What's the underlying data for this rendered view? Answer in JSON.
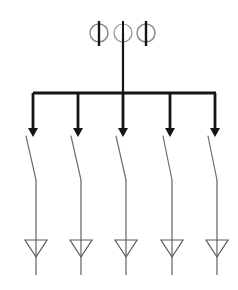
{
  "canvas": {
    "width": 238,
    "height": 290,
    "background": "#ffffff",
    "title": "Electrical Single Line Diagram - Busbar with Five Feeders"
  },
  "colors": {
    "heavy_line": "#151515",
    "medium_line": "#3a3a3a",
    "light_line": "#6e6e6e",
    "circle_stroke": "#8c8c8c",
    "triangle_stroke": "#5a5a5a",
    "background": "#ffffff"
  },
  "incomer": {
    "label": "Incoming Feeder",
    "line": {
      "x": 123,
      "y_top": 33,
      "y_bottom": 93,
      "width": 2.2
    },
    "instrument_transformers": [
      {
        "id": "ct-left",
        "label": "Instrument Transformer 1",
        "cx": 99,
        "cy": 33,
        "r": 9,
        "bar_top": 21,
        "bar_bottom": 46,
        "bar_width": 2.4,
        "ring_width": 1.5
      },
      {
        "id": "ct-center",
        "label": "Instrument Transformer 2",
        "cx": 123,
        "cy": 33,
        "r": 9,
        "bar_top": 21,
        "bar_bottom": 46,
        "bar_width": 2.0,
        "ring_width": 1.2
      },
      {
        "id": "ct-right",
        "label": "Instrument Transformer 3",
        "cx": 146,
        "cy": 33,
        "r": 9,
        "bar_top": 21,
        "bar_bottom": 46,
        "bar_width": 2.4,
        "ring_width": 1.5
      }
    ]
  },
  "busbar": {
    "label": "Main Busbar",
    "x_left": 33,
    "x_right": 216,
    "y": 93,
    "width": 3.0
  },
  "feeders": [
    {
      "id": "feeder-1",
      "label": "Feeder 1",
      "tap_x": 33,
      "drop": {
        "y_top": 93,
        "y_bottom": 133,
        "width": 2.8
      },
      "arrow": {
        "tip_y": 137,
        "half_width": 5.0,
        "height": 9
      },
      "switch": {
        "label": "Disconnector 1",
        "x1": 26,
        "y1": 136,
        "x2": 36,
        "y2": 180,
        "width": 1.2
      },
      "line": {
        "x": 36,
        "y_top": 180,
        "y_bottom": 275,
        "width": 1.3
      },
      "triangle": {
        "label": "Load Arrow 1",
        "cx": 36,
        "y_top": 240,
        "y_bottom": 257,
        "half_width": 11,
        "width": 1.2
      }
    },
    {
      "id": "feeder-2",
      "label": "Feeder 2",
      "tap_x": 78,
      "drop": {
        "y_top": 93,
        "y_bottom": 133,
        "width": 2.8
      },
      "arrow": {
        "tip_y": 137,
        "half_width": 5.0,
        "height": 9
      },
      "switch": {
        "label": "Disconnector 2",
        "x1": 71,
        "y1": 136,
        "x2": 81,
        "y2": 180,
        "width": 1.2
      },
      "line": {
        "x": 81,
        "y_top": 180,
        "y_bottom": 275,
        "width": 1.3
      },
      "triangle": {
        "label": "Load Arrow 2",
        "cx": 81,
        "y_top": 240,
        "y_bottom": 257,
        "half_width": 11,
        "width": 1.2
      }
    },
    {
      "id": "feeder-3",
      "label": "Feeder 3",
      "tap_x": 123,
      "drop": {
        "y_top": 93,
        "y_bottom": 133,
        "width": 2.8
      },
      "arrow": {
        "tip_y": 137,
        "half_width": 5.0,
        "height": 9
      },
      "switch": {
        "label": "Disconnector 3",
        "x1": 116,
        "y1": 136,
        "x2": 126,
        "y2": 180,
        "width": 1.2
      },
      "line": {
        "x": 126,
        "y_top": 180,
        "y_bottom": 275,
        "width": 1.3
      },
      "triangle": {
        "label": "Load Arrow 3",
        "cx": 126,
        "y_top": 240,
        "y_bottom": 257,
        "half_width": 11,
        "width": 1.2
      }
    },
    {
      "id": "feeder-4",
      "label": "Feeder 4",
      "tap_x": 170,
      "drop": {
        "y_top": 93,
        "y_bottom": 133,
        "width": 2.8
      },
      "arrow": {
        "tip_y": 137,
        "half_width": 5.0,
        "height": 9
      },
      "switch": {
        "label": "Disconnector 4",
        "x1": 163,
        "y1": 136,
        "x2": 172,
        "y2": 180,
        "width": 1.2
      },
      "line": {
        "x": 172,
        "y_top": 180,
        "y_bottom": 275,
        "width": 1.3
      },
      "triangle": {
        "label": "Load Arrow 4",
        "cx": 172,
        "y_top": 240,
        "y_bottom": 257,
        "half_width": 11,
        "width": 1.2
      }
    },
    {
      "id": "feeder-5",
      "label": "Feeder 5",
      "tap_x": 215,
      "drop": {
        "y_top": 93,
        "y_bottom": 133,
        "width": 2.8
      },
      "arrow": {
        "tip_y": 137,
        "half_width": 5.0,
        "height": 9
      },
      "switch": {
        "label": "Disconnector 5",
        "x1": 208,
        "y1": 136,
        "x2": 217,
        "y2": 180,
        "width": 1.2
      },
      "line": {
        "x": 217,
        "y_top": 180,
        "y_bottom": 275,
        "width": 1.3
      },
      "triangle": {
        "label": "Load Arrow 5",
        "cx": 217,
        "y_top": 240,
        "y_bottom": 257,
        "half_width": 11,
        "width": 1.2
      }
    }
  ]
}
